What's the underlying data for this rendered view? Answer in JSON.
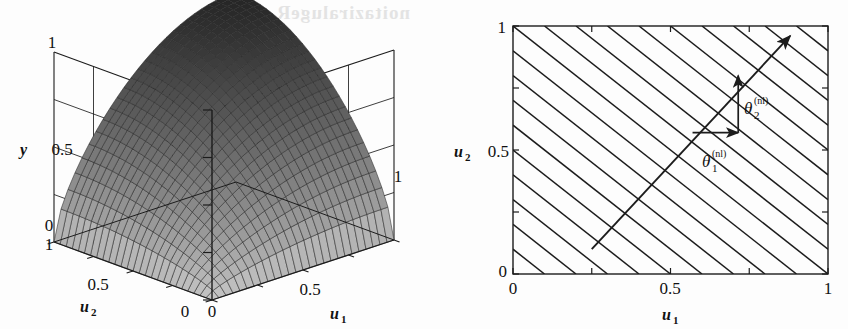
{
  "figure": {
    "background_color": "#fdfdfd",
    "ink_color": "#1a1a1a",
    "bleedthrough_text": "noitaziralugeR"
  },
  "panels": [
    {
      "id": "surface-plot",
      "kind": "3d-surface",
      "y_axis": {
        "label": "y",
        "ticks": [
          "0",
          "0.5",
          "1"
        ]
      },
      "u2_axis": {
        "label": "u",
        "subscript": "2",
        "ticks": [
          "0",
          "0.5",
          "1"
        ]
      },
      "u1_axis": {
        "label": "u",
        "subscript": "1",
        "ticks": [
          "0",
          "0.5",
          "1"
        ]
      }
    },
    {
      "id": "contour-plot",
      "kind": "contour",
      "x_axis": {
        "label": "u",
        "subscript": "1",
        "ticks": [
          "0",
          "0.5",
          "1"
        ]
      },
      "y_axis": {
        "label": "u",
        "subscript": "2",
        "ticks": [
          "0",
          "0.5",
          "1"
        ]
      },
      "annotations": [
        {
          "symbol": "θ",
          "subscript": "1",
          "superscript": "(nl)"
        },
        {
          "symbol": "θ",
          "subscript": "2",
          "superscript": "(nl)"
        }
      ]
    }
  ],
  "chart_data": [
    {
      "type": "surface",
      "title": "",
      "xlabel": "u_1",
      "ylabel": "u_2",
      "zlabel": "y",
      "xlim": [
        0,
        1
      ],
      "ylim": [
        0,
        1
      ],
      "zlim": [
        0,
        1
      ],
      "xticks": [
        0,
        0.5,
        1
      ],
      "yticks": [
        0,
        0.5,
        1
      ],
      "zticks": [
        0,
        0.5,
        1
      ],
      "grid": true,
      "legend": "none",
      "description": "Dome-shaped saturating nonlinear surface y = f(u1,u2), mesh-shaded grey, rising from 0 at the near corners to ~1 along the far ridge.",
      "mesh_n": 26,
      "surface_formula": "y = sin(pi*u1/2)^0.65 * sin(pi*u2/2)^0.65 clipped to [0,1]"
    },
    {
      "type": "contour",
      "title": "",
      "xlabel": "u_1",
      "ylabel": "u_2",
      "xlim": [
        0,
        1
      ],
      "ylim": [
        0,
        1
      ],
      "xticks": [
        0,
        0.5,
        1
      ],
      "yticks": [
        0,
        0.5,
        1
      ],
      "grid": false,
      "legend": "none",
      "description": "Family of parallel straight contour lines of slope -1 (lines u1 + u2 = c) filling the unit square, with a gradient direction arrow drawn from (0.25,0.10) to (0.88,0.96) and its two component arrows.",
      "contour_slope": -1,
      "contour_count": 19,
      "contour_intercepts": [
        0.1,
        0.2,
        0.3,
        0.4,
        0.5,
        0.6,
        0.7,
        0.8,
        0.9,
        1.0,
        1.1,
        1.2,
        1.3,
        1.4,
        1.5,
        1.6,
        1.7,
        1.8,
        1.9
      ],
      "gradient_arrow": {
        "from": [
          0.25,
          0.1
        ],
        "to": [
          0.88,
          0.96
        ]
      },
      "component_arrow_1": {
        "from": [
          0.57,
          0.57
        ],
        "to": [
          0.715,
          0.57
        ],
        "label": "theta_1^(nl)"
      },
      "component_arrow_2": {
        "from": [
          0.715,
          0.57
        ],
        "to": [
          0.715,
          0.8
        ],
        "label": "theta_2^(nl)"
      }
    }
  ]
}
